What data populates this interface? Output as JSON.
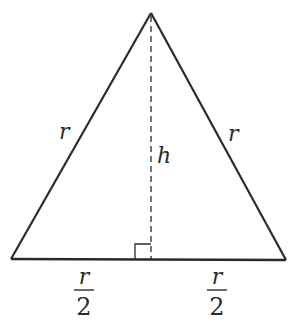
{
  "diagram": {
    "type": "isosceles-triangle-with-altitude",
    "colors": {
      "stroke": "#2b2b2b",
      "background": "#ffffff"
    },
    "vertices": {
      "apex": [
        151,
        13
      ],
      "bottom_left": [
        11,
        259
      ],
      "bottom_right": [
        286,
        260
      ]
    },
    "altitude": {
      "from": [
        151,
        13
      ],
      "to": [
        151,
        259
      ],
      "style": "dashed"
    },
    "right_angle_marker": {
      "x": 135,
      "y": 244,
      "size": 15
    },
    "labels": {
      "left_side": "r",
      "right_side": "r",
      "height": "h",
      "left_base_num": "r",
      "left_base_den": "2",
      "right_base_num": "r",
      "right_base_den": "2"
    }
  }
}
